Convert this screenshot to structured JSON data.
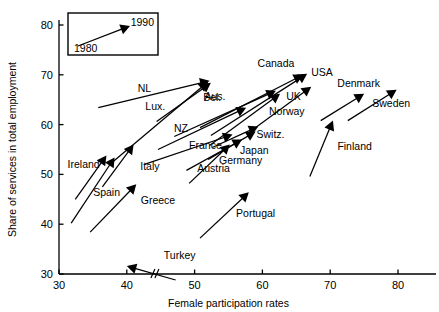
{
  "chart_data": {
    "type": "scatter",
    "title": "",
    "xlabel": "Female participation rates",
    "ylabel": "Share of services in total employment",
    "xlim": [
      30,
      82
    ],
    "ylim": [
      29,
      80
    ],
    "xticks": [
      30,
      40,
      50,
      60,
      70,
      80
    ],
    "yticks": [
      30,
      40,
      50,
      60,
      70,
      80
    ],
    "grid": false,
    "legend_position": "top-left-inset",
    "legend": {
      "start_label": "1980",
      "end_label": "1990",
      "note": "arrow points from 1980 value to 1990 value"
    },
    "annotations": [
      {
        "text": "axis break on x-axis near 44"
      }
    ],
    "series_note": "Each arrow runs from the country's 1980 position to its 1990 position.",
    "points": [
      {
        "label": "Ireland",
        "x1980": 32.4,
        "y1980": 45.0,
        "x1990": 37.0,
        "y1990": 53.8,
        "label_x": 36.0,
        "label_y": 51.2,
        "anchor": "end"
      },
      {
        "label": "Spain",
        "x1980": 31.8,
        "y1980": 40.2,
        "x1990": 38.2,
        "y1990": 53.4,
        "label_x": 39.0,
        "label_y": 45.6,
        "anchor": "end"
      },
      {
        "label": "Italy",
        "x1980": 36.4,
        "y1980": 47.5,
        "x1990": 41.0,
        "y1990": 56.0,
        "label_x": 43.4,
        "label_y": 50.8,
        "anchor": "middle"
      },
      {
        "label": "Greece",
        "x1980": 34.6,
        "y1980": 38.4,
        "x1990": 41.4,
        "y1990": 48.0,
        "label_x": 44.6,
        "label_y": 44.0,
        "anchor": "middle"
      },
      {
        "label": "Turkey",
        "x1980": 47.2,
        "y1980": 28.8,
        "x1990": 40.0,
        "y1990": 31.6,
        "label_x": 47.8,
        "label_y": 33.0,
        "anchor": "middle"
      },
      {
        "label": "NL",
        "x1980": 35.8,
        "y1980": 63.4,
        "x1990": 52.2,
        "y1990": 68.8,
        "label_x": 42.6,
        "label_y": 66.6,
        "anchor": "middle"
      },
      {
        "label": "Lux.",
        "x1980": 38.0,
        "y1980": 52.6,
        "x1990": 52.0,
        "y1990": 68.6,
        "label_x": 44.2,
        "label_y": 63.0,
        "anchor": "middle"
      },
      {
        "label": "Bel.",
        "x1980": 44.4,
        "y1980": 60.6,
        "x1990": 52.4,
        "y1990": 68.4,
        "label_x": 52.6,
        "label_y": 64.8,
        "anchor": "middle"
      },
      {
        "label": "NZ",
        "x1980": 44.6,
        "y1980": 55.0,
        "x1990": 57.6,
        "y1990": 63.4,
        "label_x": 48.0,
        "label_y": 58.6,
        "anchor": "middle"
      },
      {
        "label": "France",
        "x1980": 42.6,
        "y1980": 52.0,
        "x1990": 55.6,
        "y1990": 58.0,
        "label_x": 51.6,
        "label_y": 55.2,
        "anchor": "middle"
      },
      {
        "label": "Austria",
        "x1980": 49.2,
        "y1980": 48.2,
        "x1990": 55.2,
        "y1990": 56.0,
        "label_x": 52.8,
        "label_y": 50.4,
        "anchor": "middle"
      },
      {
        "label": "Germany",
        "x1980": 48.8,
        "y1980": 50.8,
        "x1990": 57.0,
        "y1990": 57.0,
        "label_x": 56.8,
        "label_y": 52.0,
        "anchor": "middle"
      },
      {
        "label": "Japan",
        "x1980": 52.0,
        "y1980": 53.0,
        "x1990": 59.0,
        "y1990": 58.6,
        "label_x": 58.8,
        "label_y": 54.0,
        "anchor": "middle"
      },
      {
        "label": "Switz.",
        "x1980": 52.6,
        "y1980": 55.4,
        "x1990": 59.4,
        "y1990": 59.6,
        "label_x": 61.2,
        "label_y": 57.4,
        "anchor": "middle"
      },
      {
        "label": "Aus.",
        "x1980": 47.0,
        "y1980": 57.6,
        "x1990": 62.0,
        "y1990": 66.8,
        "label_x": 53.0,
        "label_y": 65.0,
        "anchor": "middle"
      },
      {
        "label": "Canada",
        "x1980": 50.8,
        "y1980": 59.4,
        "x1990": 66.0,
        "y1990": 70.0,
        "label_x": 62.0,
        "label_y": 71.6,
        "anchor": "middle"
      },
      {
        "label": "USA",
        "x1980": 52.4,
        "y1980": 57.8,
        "x1990": 66.6,
        "y1990": 70.2,
        "label_x": 68.8,
        "label_y": 69.8,
        "anchor": "middle"
      },
      {
        "label": "UK",
        "x1980": 52.2,
        "y1980": 55.8,
        "x1990": 62.6,
        "y1990": 66.2,
        "label_x": 64.6,
        "label_y": 65.0,
        "anchor": "middle"
      },
      {
        "label": "Norway",
        "x1980": 57.8,
        "y1980": 58.2,
        "x1990": 67.2,
        "y1990": 67.6,
        "label_x": 63.6,
        "label_y": 62.0,
        "anchor": "middle"
      },
      {
        "label": "Denmark",
        "x1980": 68.6,
        "y1980": 60.8,
        "x1990": 75.0,
        "y1990": 66.2,
        "label_x": 74.2,
        "label_y": 67.6,
        "anchor": "middle"
      },
      {
        "label": "Sweden",
        "x1980": 72.6,
        "y1980": 60.8,
        "x1990": 79.8,
        "y1990": 67.0,
        "label_x": 79.0,
        "label_y": 63.6,
        "anchor": "middle"
      },
      {
        "label": "Finland",
        "x1980": 67.0,
        "y1980": 49.6,
        "x1990": 70.4,
        "y1990": 60.8,
        "label_x": 73.6,
        "label_y": 55.0,
        "anchor": "middle"
      },
      {
        "label": "Portugal",
        "x1980": 50.8,
        "y1980": 37.2,
        "x1990": 58.0,
        "y1990": 46.4,
        "label_x": 59.0,
        "label_y": 41.4,
        "anchor": "middle"
      }
    ]
  },
  "axes": {
    "x_title": "Female participation rates",
    "y_title": "Share of services in total employment",
    "x_tick_labels": [
      "30",
      "40",
      "50",
      "60",
      "70",
      "80"
    ],
    "y_tick_labels": [
      "30",
      "40",
      "50",
      "60",
      "70",
      "80"
    ]
  },
  "colors": {
    "ink": "#000000",
    "background": "#ffffff"
  }
}
